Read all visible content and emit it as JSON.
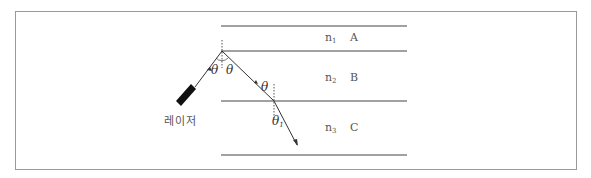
{
  "diagram": {
    "type": "optics-reflection-refraction",
    "laser_label": "레이저",
    "layers": [
      {
        "index_symbol": "n",
        "index_sub": "1",
        "name": "A"
      },
      {
        "index_symbol": "n",
        "index_sub": "2",
        "name": "B"
      },
      {
        "index_symbol": "n",
        "index_sub": "3",
        "name": "C"
      }
    ],
    "angles": {
      "incident": "θ",
      "reflected": "θ",
      "incident_at_lower_boundary": "θ",
      "refracted_symbol": "θ",
      "refracted_sub": "1"
    },
    "colors": {
      "line": "#444444",
      "dotted_normal": "#555555",
      "laser_body": "#111111",
      "border": "#9a9a9a"
    }
  }
}
